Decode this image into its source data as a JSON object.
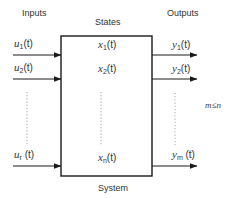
{
  "diagram": {
    "type": "block-diagram",
    "colors": {
      "stroke": "#1a1a1a",
      "text": "#333333",
      "dots": "#888888",
      "background": "#ffffff"
    },
    "labels": {
      "inputs": "Inputs",
      "states": "States",
      "outputs": "Outputs",
      "system": "System",
      "constraint": "m≤n"
    },
    "inputs": [
      {
        "var": "u",
        "sub": "1",
        "arg": "(t)"
      },
      {
        "var": "u",
        "sub": "2",
        "arg": "(t)"
      },
      {
        "var": "u",
        "sub": "r",
        "arg": "(t)"
      }
    ],
    "states": [
      {
        "var": "x",
        "sub": "1",
        "arg": "(t)"
      },
      {
        "var": "x",
        "sub": "2",
        "arg": "(t)"
      },
      {
        "var": "x",
        "sub": "n",
        "arg": "(t)"
      }
    ],
    "outputs": [
      {
        "var": "y",
        "sub": "1",
        "arg": "(t)"
      },
      {
        "var": "y",
        "sub": "2",
        "arg": "(t)"
      },
      {
        "var": "y",
        "sub": "m",
        "arg": "(t)"
      }
    ]
  }
}
